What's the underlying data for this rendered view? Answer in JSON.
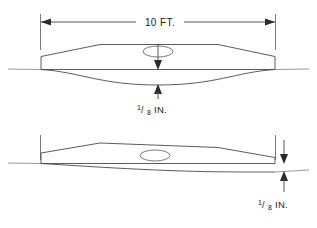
{
  "diagram": {
    "background_color": "#ffffff",
    "line_color": "#4a4a4a",
    "arrow_color": "#2b2b2b",
    "views": [
      {
        "id": "top-view",
        "name": "supported-span-view",
        "span_dimension": {
          "label": "10 FT.",
          "value": 10,
          "unit": "FT."
        },
        "deflection": {
          "numerator": "1",
          "slash": "/",
          "denominator": "8",
          "unit": "IN.",
          "full_label": "1/8 IN."
        },
        "has_center_hole": true,
        "hole_shape": "ellipse"
      },
      {
        "id": "bottom-view",
        "name": "end-deflection-view",
        "deflection": {
          "numerator": "1",
          "slash": "/",
          "denominator": "8",
          "unit": "IN.",
          "full_label": "1/8 IN."
        },
        "has_center_hole": true,
        "hole_shape": "ellipse"
      }
    ]
  }
}
